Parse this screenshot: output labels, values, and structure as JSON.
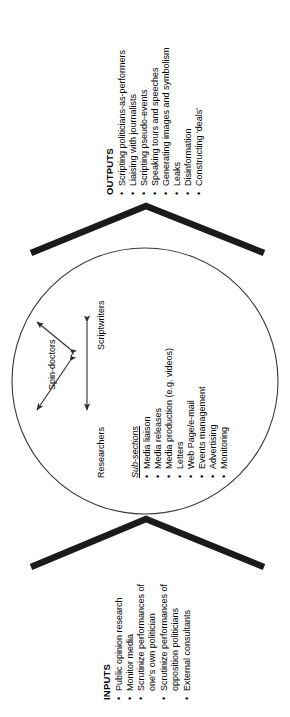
{
  "diagram": {
    "orientation": "rotated-90-ccw",
    "background_color": "#ffffff",
    "line_color": "#000000",
    "chevron_color": "#1a1a1a",
    "inputs": {
      "heading": "INPUTS",
      "items": [
        "Public opinion research",
        "Monitor media",
        "Scrutinize performances of one's own politician",
        "Scrutinize performances of opposition politicians",
        "External consultants"
      ],
      "item_lines": [
        [
          "Public opinion research"
        ],
        [
          "Monitor media"
        ],
        [
          "Scrutinize performances of",
          "one's own politician"
        ],
        [
          "Scrutinize performances of",
          "opposition politicians"
        ],
        [
          "External consultants"
        ]
      ]
    },
    "outputs": {
      "heading": "OUTPUTS",
      "items": [
        "Scripting politicians-as-performers",
        "Liaising with journalists",
        "Scripting pseudo-events",
        "Speaking tours and speeches",
        "Generating images and symbolism",
        "Leaks",
        "Disinformation",
        "Constructing 'deals'"
      ]
    },
    "core": {
      "shape": "circle",
      "nodes": [
        {
          "id": "spin-doctors",
          "label": "Spin-doctors"
        },
        {
          "id": "scriptwriters",
          "label": "Scriptwriters"
        },
        {
          "id": "researchers",
          "label": "Researchers"
        }
      ],
      "connections": [
        {
          "from": "Spin-doctors",
          "to": "Scriptwriters",
          "type": "double-arrow"
        },
        {
          "from": "Spin-doctors",
          "to": "Researchers",
          "type": "double-arrow"
        },
        {
          "from": "Scriptwriters",
          "to": "Researchers",
          "type": "double-arrow"
        }
      ],
      "subsections": {
        "heading": "Sub-sections",
        "items": [
          "Media liaison",
          "Media releases",
          "Media production (e.g. videos)",
          "Letters",
          "Web Page/e-mail",
          "Events management",
          "Advertising",
          "Monitoring"
        ]
      }
    },
    "bullet_glyph": "•"
  }
}
